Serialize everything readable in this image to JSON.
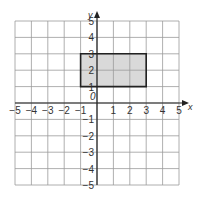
{
  "diagram": {
    "type": "coordinate-grid",
    "x_axis": {
      "label": "x",
      "min": -5,
      "max": 5,
      "ticks": [
        "-5",
        "-4",
        "-3",
        "-2",
        "-1",
        "1",
        "2",
        "3",
        "4",
        "5"
      ]
    },
    "y_axis": {
      "label": "y",
      "min": -5,
      "max": 5,
      "ticks": [
        "5",
        "4",
        "3",
        "2",
        "1",
        "-1",
        "-2",
        "-3",
        "-4",
        "-5"
      ]
    },
    "origin_label": "0",
    "shapes": [
      {
        "name": "rectangle",
        "vertices": [
          [
            -1,
            1
          ],
          [
            3,
            1
          ],
          [
            3,
            3
          ],
          [
            -1,
            3
          ]
        ],
        "fill": "#d9d9d9",
        "stroke": "#222222"
      }
    ],
    "colors": {
      "grid": "#9a9a9a",
      "axis": "#222222",
      "text": "#333333"
    }
  }
}
